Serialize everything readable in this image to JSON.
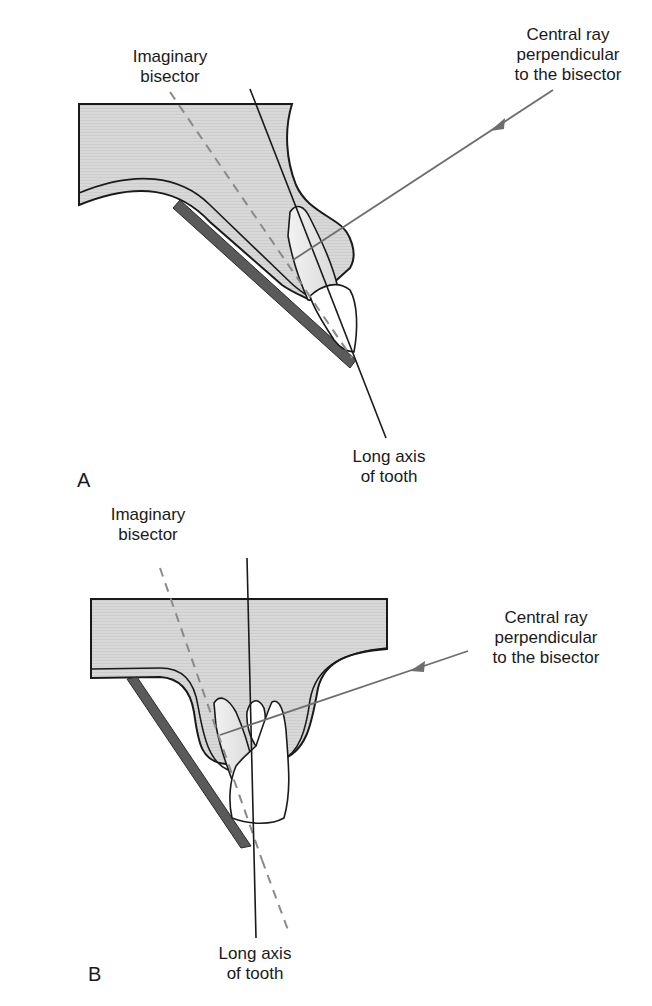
{
  "panels": [
    {
      "id": "A",
      "letter": "A",
      "labels": {
        "bisector": [
          "Imaginary",
          "bisector"
        ],
        "central_ray": [
          "Central ray",
          "perpendicular",
          "to the bisector"
        ],
        "long_axis": [
          "Long axis",
          "of tooth"
        ]
      }
    },
    {
      "id": "B",
      "letter": "B",
      "labels": {
        "bisector": [
          "Imaginary",
          "bisector"
        ],
        "central_ray": [
          "Central ray",
          "perpendicular",
          "to the bisector"
        ],
        "long_axis": [
          "Long axis",
          "of tooth"
        ]
      }
    }
  ],
  "colors": {
    "tissue_fill": "#d6d6d6",
    "tissue_inner": "#cfcfcf",
    "outline": "#1a1a1a",
    "film": "#5a5a5a",
    "ray": "#6e6e6e",
    "bisector": "#8a8a8a",
    "tooth": "#ffffff"
  }
}
